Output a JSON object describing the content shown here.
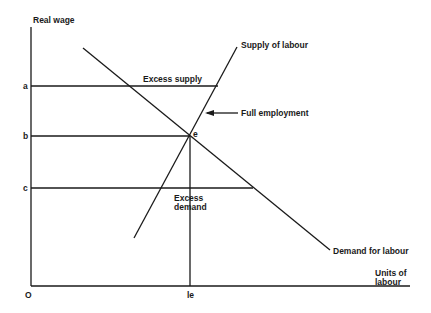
{
  "diagram": {
    "axes": {
      "y_label": "Real wage",
      "x_label_line1": "Units of",
      "x_label_line2": "labour",
      "origin": "O"
    },
    "wage_levels": {
      "a": "a",
      "b": "b",
      "c": "c"
    },
    "curves": {
      "supply": "Supply of labour",
      "demand": "Demand for labour"
    },
    "annotations": {
      "excess_supply": "Excess supply",
      "excess_demand_line1": "Excess",
      "excess_demand_line2": "demand",
      "full_employment": "Full employment",
      "equilibrium_point": "e",
      "equilibrium_quantity": "le"
    },
    "colors": {
      "ink": "#1a1a1a",
      "background": "#ffffff"
    }
  }
}
